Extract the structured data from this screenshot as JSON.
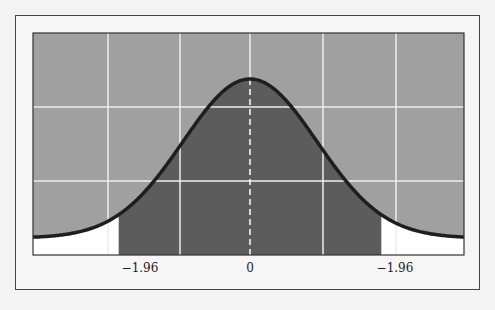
{
  "chart_data": {
    "type": "area",
    "title": "",
    "xlabel": "",
    "ylabel": "",
    "tick_labels": [
      "−1.96",
      "0",
      "−1.96"
    ],
    "tick_values": [
      -1.96,
      0,
      1.96
    ],
    "xlim": [
      -3.24,
      3.24
    ],
    "shaded_region": [
      -1.96,
      1.96
    ],
    "mean_line": 0,
    "grid": true,
    "legend": null
  },
  "colors": {
    "above_curve": "#a0a0a0",
    "central_region": "#5c5c5c",
    "tails": "#ffffff",
    "curve": "#1e1e1e",
    "grid": "#f0f0f0"
  },
  "labels": {
    "left": "−1.96",
    "center": "0",
    "right": "−1.96"
  }
}
